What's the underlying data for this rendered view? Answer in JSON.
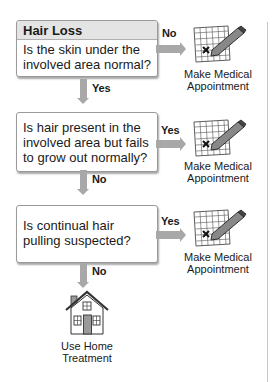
{
  "title": "Hair Loss",
  "steps": [
    {
      "question": "Is the skin under the involved area normal?",
      "side_label": "No",
      "down_label": "Yes",
      "side_outcome": {
        "icon": "calendar-pencil-icon",
        "label_line1": "Make Medical",
        "label_line2": "Appointment"
      }
    },
    {
      "question": "Is hair present in the involved area but fails to grow out normally?",
      "side_label": "Yes",
      "down_label": "No",
      "side_outcome": {
        "icon": "calendar-pencil-icon",
        "label_line1": "Make Medical",
        "label_line2": "Appointment"
      }
    },
    {
      "question": "Is continual hair pulling suspected?",
      "side_label": "Yes",
      "down_label": "No",
      "side_outcome": {
        "icon": "calendar-pencil-icon",
        "label_line1": "Make Medical",
        "label_line2": "Appointment"
      }
    }
  ],
  "final_outcome": {
    "icon": "house-icon",
    "label_line1": "Use Home",
    "label_line2": "Treatment"
  },
  "colors": {
    "arrow": "#a8a8a8",
    "header_band": "#e4e4e4",
    "border": "#9a9a9a"
  }
}
